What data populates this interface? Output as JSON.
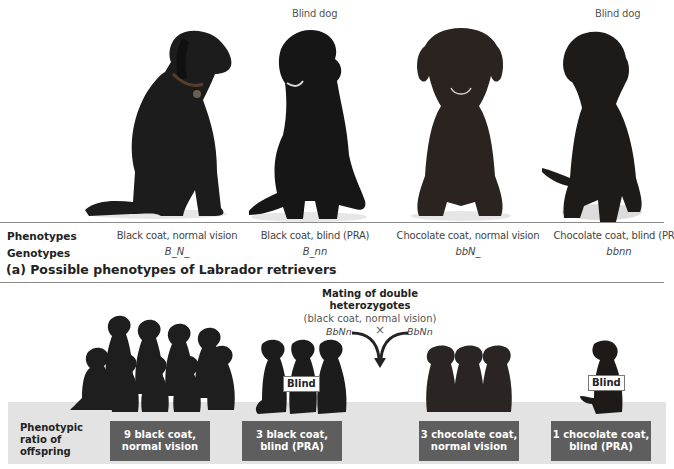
{
  "top_panel": {
    "blind_captions": [
      "Blind dog",
      "Blind dog"
    ],
    "dogs": [
      {
        "name": "black-coat-normal-vision-dog",
        "coat": "#1c1c1c"
      },
      {
        "name": "black-coat-blind-dog",
        "coat": "#161616"
      },
      {
        "name": "chocolate-coat-normal-vision-dog",
        "coat": "#2a2320"
      },
      {
        "name": "chocolate-coat-blind-dog",
        "coat": "#1e1a18"
      }
    ],
    "row_labels": {
      "phenotypes": "Phenotypes",
      "genotypes": "Genotypes"
    },
    "phenotypes": [
      "Black coat, normal vision",
      "Black coat, blind (PRA)",
      "Chocolate coat, normal vision",
      "Chocolate coat, blind (PRA)"
    ],
    "genotypes": [
      "B_N_",
      "B_nn",
      "bbN_",
      "bbnn"
    ],
    "title": "(a) Possible phenotypes of Labrador retrievers"
  },
  "mating": {
    "title_line1": "Mating of double",
    "title_line2": "heterozygotes",
    "subtitle": "(black coat, normal vision)",
    "parent_left": "BbNn",
    "parent_right": "BbNn",
    "cross_symbol": "×"
  },
  "offspring": {
    "ratio_label_lines": [
      "Phenotypic",
      "ratio of",
      "offspring"
    ],
    "blind_tag": "Blind",
    "groups": [
      {
        "count": 9,
        "line1": "9 black coat,",
        "line2": "normal vision"
      },
      {
        "count": 3,
        "line1": "3 black coat,",
        "line2": "blind (PRA)"
      },
      {
        "count": 3,
        "line1": "3 chocolate coat,",
        "line2": "normal vision"
      },
      {
        "count": 1,
        "line1": "1 chocolate coat,",
        "line2": "blind (PRA)"
      }
    ]
  },
  "colors": {
    "panel_bg": "#e3e3e3",
    "ratio_box_bg": "#5e5e5e",
    "divider": "#8a8a8a"
  }
}
